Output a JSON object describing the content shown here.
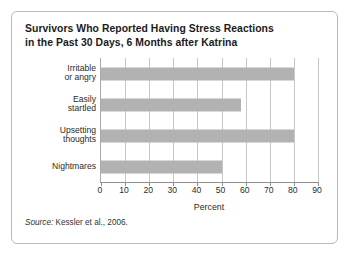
{
  "figure": {
    "title_line_1": "Survivors Who Reported Having Stress Reactions",
    "title_line_2": "in the Past 30 Days, 6 Months after Katrina",
    "source_label": "Source:",
    "source_text": " Kessler et al., 2006."
  },
  "colors": {
    "bar_fill": "#b2b2b2",
    "gridline": "#c8c8c8",
    "axis": "#8e8e8e",
    "text": "#2b2b2b",
    "title": "#1b1b1b",
    "card_border": "#b9b9b9"
  },
  "chart_data": {
    "type": "bar",
    "orientation": "horizontal",
    "title": "Survivors Who Reported Having Stress Reactions in the Past 30 Days, 6 Months after Katrina",
    "categories": [
      "Irritable\nor angry",
      "Easily\nstartled",
      "Upsetting\nthoughts",
      "Nightmares"
    ],
    "category_lines": [
      [
        "Irritable",
        "or angry"
      ],
      [
        "Easily",
        "startled"
      ],
      [
        "Upsetting",
        "thoughts"
      ],
      [
        "Nightmares"
      ]
    ],
    "values": [
      80,
      58,
      80,
      50
    ],
    "xlabel": "Percent",
    "ylabel": "",
    "xlim": [
      0,
      90
    ],
    "xticks": [
      0,
      10,
      20,
      30,
      40,
      50,
      60,
      70,
      80,
      90
    ],
    "xtick_labels": [
      "0",
      "10",
      "20",
      "30",
      "40",
      "50",
      "60",
      "70",
      "80",
      "90"
    ],
    "grid": "vertical",
    "legend": "none",
    "source": "Source: Kessler et al., 2006."
  }
}
